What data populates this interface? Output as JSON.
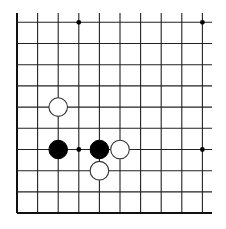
{
  "board": {
    "type": "go-board-fragment",
    "visible_region": "lower-left corner",
    "columns": 10,
    "rows": 10,
    "origin_x": 17,
    "origin_y": 22.3,
    "col_spacing": 20.6,
    "row_spacing": 21.2,
    "line_top_extend_y": 13,
    "line_right_extend_x": 212,
    "edges": [
      "left",
      "bottom"
    ],
    "line_color": "#222222",
    "edge_line_color": "#111111",
    "background_color": "#ffffff",
    "stone_radius": 9.3,
    "star_points": [
      {
        "col": 3,
        "row": 0
      },
      {
        "col": 9,
        "row": 0
      },
      {
        "col": 3,
        "row": 6
      },
      {
        "col": 9,
        "row": 6
      }
    ],
    "stones": [
      {
        "color": "white",
        "col": 2,
        "row": 4
      },
      {
        "color": "black",
        "col": 2,
        "row": 6
      },
      {
        "color": "black",
        "col": 4,
        "row": 6
      },
      {
        "color": "white",
        "col": 5,
        "row": 6
      },
      {
        "color": "white",
        "col": 4,
        "row": 7
      }
    ]
  }
}
